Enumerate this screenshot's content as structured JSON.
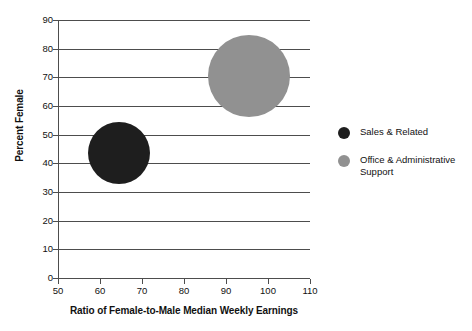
{
  "chart_data": {
    "type": "scatter",
    "title": "",
    "xlabel": "Ratio of Female-to-Male Median Weekly Earnings",
    "ylabel": "Percent Female",
    "xlim": [
      50,
      110
    ],
    "ylim": [
      0,
      90
    ],
    "xticks": [
      50,
      60,
      70,
      80,
      90,
      100,
      110
    ],
    "yticks": [
      0,
      10,
      20,
      30,
      40,
      50,
      60,
      70,
      80,
      90
    ],
    "grid": true,
    "grid_axis": "y",
    "legend_position": "right",
    "points": [
      {
        "name": "Sales & Related",
        "x": 64.5,
        "y": 43.5,
        "size": 62,
        "color": "#1e1e1e"
      },
      {
        "name": "Office & Administrative Support",
        "x": 95.5,
        "y": 70.5,
        "size": 82,
        "color": "#919191"
      }
    ],
    "series": [
      {
        "name": "Sales & Related",
        "values": [
          43.5
        ]
      },
      {
        "name": "Office & Administrative Support",
        "values": [
          70.5
        ]
      }
    ]
  },
  "axes": {
    "y_title": "Percent Female",
    "x_title": "Ratio of Female-to-Male Median Weekly Earnings",
    "y_tick_labels": [
      "90",
      "80",
      "70",
      "60",
      "50",
      "40",
      "30",
      "20",
      "10",
      "0"
    ],
    "x_tick_labels": [
      "50",
      "60",
      "70",
      "80",
      "90",
      "100",
      "110"
    ]
  },
  "legend": {
    "items": [
      {
        "label": "Sales & Related",
        "color": "#1e1e1e"
      },
      {
        "label": "Office & Administrative Support",
        "color": "#919191"
      }
    ]
  },
  "colors": {
    "grid": "#4d4d4d",
    "axis": "#4d4d4d",
    "text": "#111111",
    "background": "#ffffff",
    "series_dark": "#1e1e1e",
    "series_gray": "#919191"
  }
}
